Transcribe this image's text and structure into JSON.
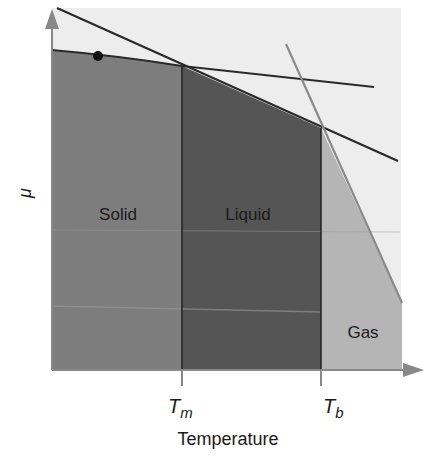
{
  "diagram": {
    "y_axis_label": "μ",
    "x_axis_label": "Temperature",
    "ticks": [
      {
        "main": "T",
        "sub": "m"
      },
      {
        "main": "T",
        "sub": "b"
      }
    ],
    "regions": {
      "solid": "Solid",
      "liquid": "Liquid",
      "gas": "Gas"
    },
    "colors": {
      "background": "#ededed",
      "solid": "#7d7d7d",
      "liquid": "#555555",
      "gas": "#b5b5b5",
      "axis": "#888888",
      "line": "#2a2a2a",
      "gas_line": "#8a8a8a"
    }
  }
}
